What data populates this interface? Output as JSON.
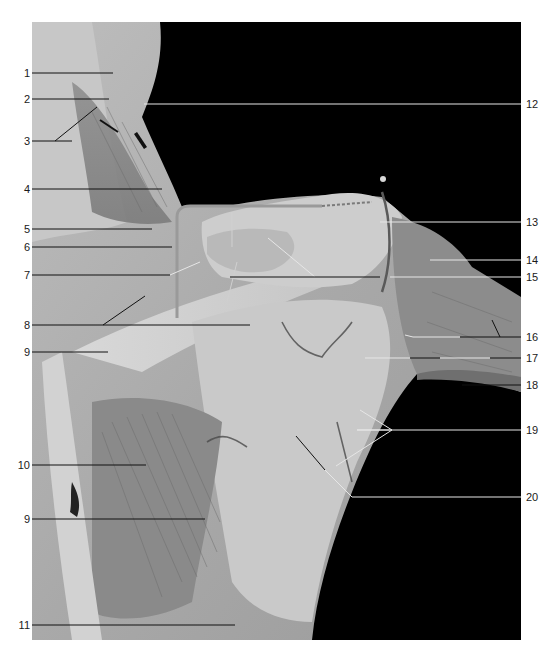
{
  "figure": {
    "type": "anatomical dissection photograph",
    "background_color": "#000000",
    "page_color": "#ffffff",
    "label_line_dark": "#111111",
    "label_line_light": "#e6e6e6"
  },
  "labels_left": [
    {
      "number": "1",
      "y": 73
    },
    {
      "number": "2",
      "y": 99
    },
    {
      "number": "3",
      "y": 141
    },
    {
      "number": "4",
      "y": 189
    },
    {
      "number": "5",
      "y": 229
    },
    {
      "number": "6",
      "y": 247
    },
    {
      "number": "7",
      "y": 275
    },
    {
      "number": "8",
      "y": 325
    },
    {
      "number": "9",
      "y": 352
    },
    {
      "number": "10",
      "y": 465
    },
    {
      "number": "9",
      "y": 519
    },
    {
      "number": "11",
      "y": 625
    }
  ],
  "labels_right": [
    {
      "number": "12",
      "y": 104
    },
    {
      "number": "13",
      "y": 222
    },
    {
      "number": "14",
      "y": 260
    },
    {
      "number": "15",
      "y": 277
    },
    {
      "number": "16",
      "y": 337
    },
    {
      "number": "17",
      "y": 358
    },
    {
      "number": "18",
      "y": 385
    },
    {
      "number": "19",
      "y": 430
    },
    {
      "number": "20",
      "y": 497
    }
  ]
}
